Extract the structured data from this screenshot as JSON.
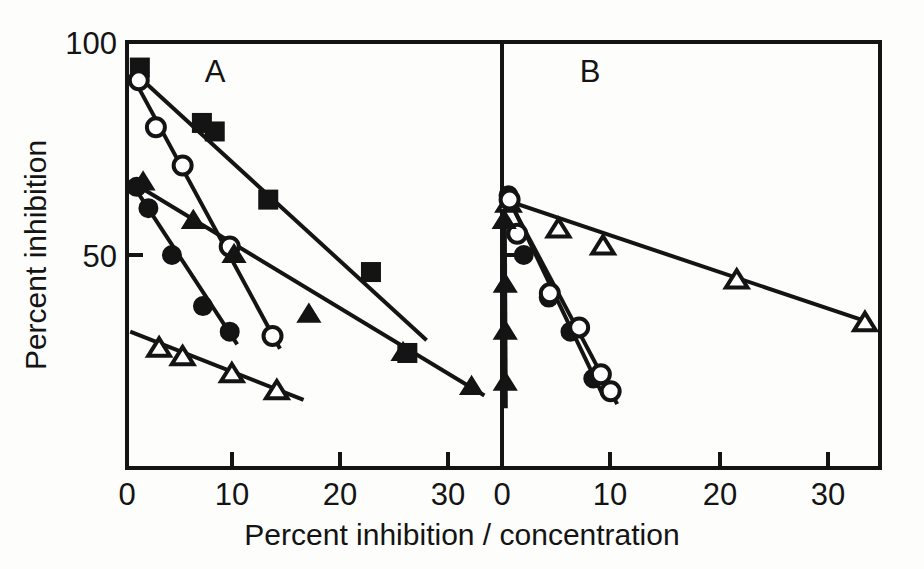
{
  "figure": {
    "kind": "scatchard-plot",
    "background_color": "#fdfdfc",
    "ink_color": "#141414",
    "marker_fill_open": "#ffffff",
    "panels": [
      {
        "id": "A",
        "label": "A"
      },
      {
        "id": "B",
        "label": "B"
      }
    ]
  },
  "axes": {
    "y": {
      "label": "Percent  inhibition",
      "ticks": [
        {
          "value": 100,
          "label": "100"
        },
        {
          "value": 50,
          "label": "50"
        }
      ],
      "range": [
        0,
        100
      ]
    },
    "x": {
      "label": "Percent   inhibition / concentration",
      "label_parts": {
        "word1": "Percent",
        "word2": "inhibition",
        "slash": "/",
        "word3": "concentration"
      },
      "panel_a_ticks": [
        {
          "value": 0,
          "label": "0"
        },
        {
          "value": 10,
          "label": "10"
        },
        {
          "value": 20,
          "label": "20"
        },
        {
          "value": 30,
          "label": "30"
        }
      ],
      "panel_b_ticks": [
        {
          "value": 0,
          "label": "0"
        },
        {
          "value": 10,
          "label": "10"
        },
        {
          "value": 20,
          "label": "20"
        },
        {
          "value": 30,
          "label": "30"
        }
      ],
      "range": [
        0,
        34
      ]
    }
  },
  "chart_data": {
    "type": "scatter",
    "title": "",
    "subtitle": "",
    "xlabel": "Percent inhibition / concentration",
    "ylabel": "Percent inhibition",
    "xlim": [
      0,
      34
    ],
    "ylim": [
      0,
      100
    ],
    "grid": false,
    "legend": "none",
    "annotations": [
      "A",
      "B"
    ],
    "panels": [
      {
        "name": "A",
        "xlim": [
          0,
          34
        ],
        "ylim": [
          0,
          100
        ],
        "series": [
          {
            "name": "filled-square",
            "marker": "filled-square",
            "points": [
              {
                "x": 1.2,
                "y": 94
              },
              {
                "x": 7.0,
                "y": 81
              },
              {
                "x": 8.2,
                "y": 79
              },
              {
                "x": 13.2,
                "y": 63
              },
              {
                "x": 22.8,
                "y": 46
              },
              {
                "x": 26.2,
                "y": 27
              }
            ],
            "fit_line": {
              "x1": 0.6,
              "y1": 93,
              "x2": 28.0,
              "y2": 30
            }
          },
          {
            "name": "open-circle",
            "marker": "open-circle",
            "points": [
              {
                "x": 1.1,
                "y": 91
              },
              {
                "x": 2.7,
                "y": 80
              },
              {
                "x": 5.2,
                "y": 71
              },
              {
                "x": 9.6,
                "y": 52
              },
              {
                "x": 13.6,
                "y": 31
              }
            ],
            "fit_line": {
              "x1": 0.5,
              "y1": 92,
              "x2": 14.3,
              "y2": 28
            }
          },
          {
            "name": "filled-triangle",
            "marker": "filled-triangle",
            "points": [
              {
                "x": 1.5,
                "y": 67
              },
              {
                "x": 6.2,
                "y": 58
              },
              {
                "x": 10.0,
                "y": 50
              },
              {
                "x": 17.0,
                "y": 36
              },
              {
                "x": 25.8,
                "y": 27
              },
              {
                "x": 32.2,
                "y": 19
              }
            ],
            "fit_line": {
              "x1": 0.5,
              "y1": 67,
              "x2": 33.4,
              "y2": 17
            }
          },
          {
            "name": "filled-circle",
            "marker": "filled-circle",
            "points": [
              {
                "x": 0.9,
                "y": 66
              },
              {
                "x": 2.0,
                "y": 61
              },
              {
                "x": 4.2,
                "y": 50
              },
              {
                "x": 7.1,
                "y": 38
              },
              {
                "x": 9.6,
                "y": 32
              }
            ],
            "fit_line": {
              "x1": 0.4,
              "y1": 67,
              "x2": 10.3,
              "y2": 29
            }
          },
          {
            "name": "open-triangle",
            "marker": "open-triangle",
            "points": [
              {
                "x": 3.0,
                "y": 28
              },
              {
                "x": 5.2,
                "y": 26
              },
              {
                "x": 9.8,
                "y": 22
              },
              {
                "x": 14.0,
                "y": 18
              }
            ],
            "fit_line": {
              "x1": 0.3,
              "y1": 32,
              "x2": 16.5,
              "y2": 16
            }
          }
        ]
      },
      {
        "name": "B",
        "xlim": [
          0,
          34
        ],
        "ylim": [
          0,
          100
        ],
        "series": [
          {
            "name": "open-triangle",
            "marker": "open-triangle",
            "points": [
              {
                "x": 0.6,
                "y": 62
              },
              {
                "x": 5.2,
                "y": 56
              },
              {
                "x": 9.3,
                "y": 52
              },
              {
                "x": 21.6,
                "y": 44
              },
              {
                "x": 33.4,
                "y": 34
              }
            ],
            "fit_line": {
              "x1": 0.2,
              "y1": 63,
              "x2": 34.0,
              "y2": 34
            }
          },
          {
            "name": "filled-circle",
            "marker": "filled-circle",
            "points": [
              {
                "x": 0.6,
                "y": 64
              },
              {
                "x": 2.0,
                "y": 50
              },
              {
                "x": 4.3,
                "y": 40
              },
              {
                "x": 6.3,
                "y": 32
              },
              {
                "x": 8.4,
                "y": 21
              }
            ],
            "fit_line": {
              "x1": 0.3,
              "y1": 65,
              "x2": 9.3,
              "y2": 17
            }
          },
          {
            "name": "open-circle",
            "marker": "open-circle",
            "points": [
              {
                "x": 0.7,
                "y": 63
              },
              {
                "x": 1.4,
                "y": 55
              },
              {
                "x": 4.4,
                "y": 41
              },
              {
                "x": 7.1,
                "y": 33
              },
              {
                "x": 9.1,
                "y": 22
              },
              {
                "x": 10.0,
                "y": 18
              }
            ],
            "fit_line": {
              "x1": 0.4,
              "y1": 64,
              "x2": 10.6,
              "y2": 15
            }
          },
          {
            "name": "filled-triangle",
            "marker": "filled-triangle",
            "points": [
              {
                "x": 0.2,
                "y": 58
              },
              {
                "x": 0.3,
                "y": 43
              },
              {
                "x": 0.3,
                "y": 32
              },
              {
                "x": 0.3,
                "y": 20
              }
            ],
            "fit_line": {
              "x1": 0.25,
              "y1": 62,
              "x2": 0.35,
              "y2": 14
            }
          }
        ]
      }
    ]
  }
}
